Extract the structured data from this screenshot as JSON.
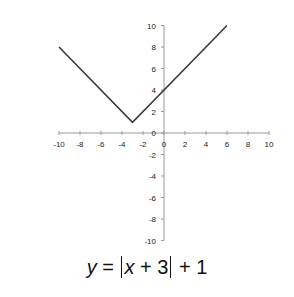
{
  "chart_data": {
    "type": "line",
    "xlabel": "",
    "ylabel": "",
    "xlim": [
      -10,
      10
    ],
    "ylim": [
      -10,
      10
    ],
    "x_ticks": [
      -10,
      -8,
      -6,
      -4,
      -2,
      0,
      2,
      4,
      6,
      8,
      10
    ],
    "y_ticks": [
      -10,
      -8,
      -6,
      -4,
      -2,
      0,
      2,
      4,
      6,
      8,
      10
    ],
    "grid": false,
    "legend": null,
    "series": [
      {
        "name": "y = |x+3|+1",
        "x": [
          -10,
          -3,
          6
        ],
        "y": [
          8,
          1,
          10
        ],
        "color": "#3a3a3a"
      }
    ]
  },
  "equation": {
    "y": "y",
    "eq": " = ",
    "x": "x",
    "inner": " + 3",
    "outer": " + 1"
  }
}
